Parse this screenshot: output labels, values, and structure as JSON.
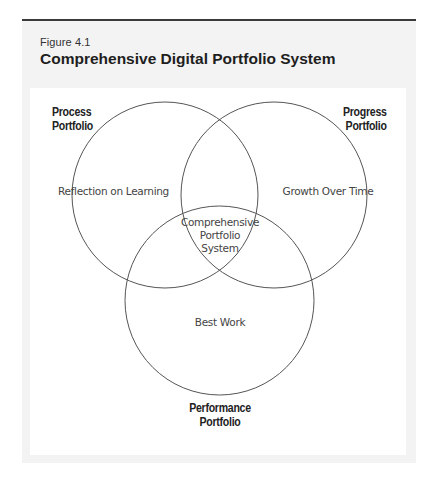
{
  "figure": {
    "number": "Figure 4.1",
    "title": "Comprehensive Digital Portfolio System"
  },
  "diagram": {
    "type": "venn",
    "sets": [
      {
        "name": "process",
        "label_line1": "Process",
        "label_line2": "Portfolio",
        "region_text": "Reflection on Learning"
      },
      {
        "name": "progress",
        "label_line1": "Progress",
        "label_line2": "Portfolio",
        "region_text": "Growth Over Time"
      },
      {
        "name": "performance",
        "label_line1": "Performance",
        "label_line2": "Portfolio",
        "region_text": "Best Work"
      }
    ],
    "center": {
      "line1": "Comprehensive",
      "line2": "Portfolio",
      "line3": "System"
    }
  },
  "colors": {
    "rule": "#3a3a3a",
    "panel": "#f3f3f3",
    "stroke": "#555555"
  }
}
